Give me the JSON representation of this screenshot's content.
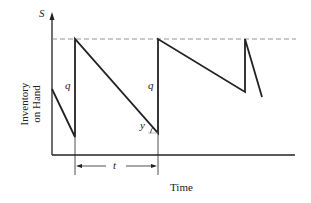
{
  "diagram": {
    "y_axis_symbol": "S",
    "y_axis_label_line1": "Inventory",
    "y_axis_label_line2": "on Hand",
    "x_axis_label": "Time",
    "order_quantity_label_1": "q",
    "order_quantity_label_2": "q",
    "angle_label": "y",
    "period_label": "t",
    "line_color": "#222222",
    "dashed_line_color": "#888888"
  }
}
